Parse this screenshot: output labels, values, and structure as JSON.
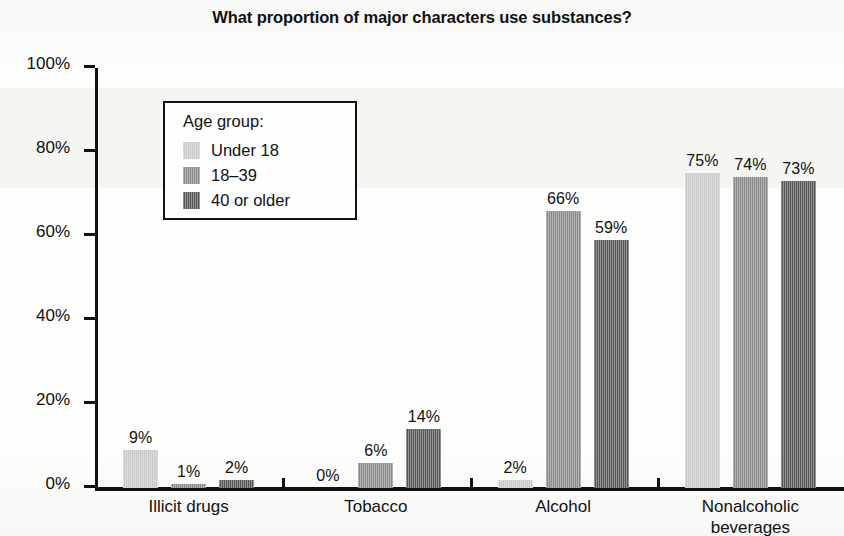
{
  "chart_data": {
    "type": "bar",
    "title": "What proportion of major characters use substances?",
    "xlabel": "",
    "ylabel": "",
    "ylim": [
      0,
      100
    ],
    "ytick_labels": [
      "0%",
      "20%",
      "40%",
      "60%",
      "80%",
      "100%"
    ],
    "ytick_values": [
      0,
      20,
      40,
      60,
      80,
      100
    ],
    "grid": false,
    "legend_position": "upper-left-inside",
    "legend_title": "Age group:",
    "categories": [
      "Illicit drugs",
      "Tobacco",
      "Alcohol",
      "Nonalcoholic\nbeverages"
    ],
    "series": [
      {
        "name": "Under 18",
        "color": "#c9c9c9",
        "values": [
          9,
          0,
          2,
          75
        ],
        "labels": [
          "9%",
          "0%",
          "2%",
          "75%"
        ]
      },
      {
        "name": "18–39",
        "color": "#8a8a8a",
        "values": [
          1,
          6,
          66,
          74
        ],
        "labels": [
          "1%",
          "6%",
          "66%",
          "74%"
        ]
      },
      {
        "name": "40 or older",
        "color": "#585858",
        "values": [
          2,
          14,
          59,
          73
        ],
        "labels": [
          "2%",
          "14%",
          "59%",
          "73%"
        ]
      }
    ]
  }
}
